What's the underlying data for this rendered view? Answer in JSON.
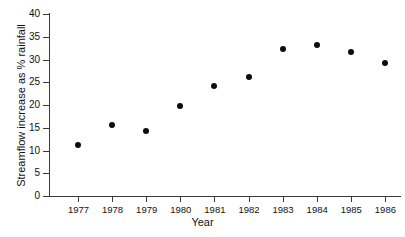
{
  "chart_data": {
    "type": "scatter",
    "title": "",
    "xlabel": "Year",
    "ylabel": "Streamflow increase as % rainfall",
    "categories": [
      "1977",
      "1978",
      "1979",
      "1980",
      "1981",
      "1982",
      "1983",
      "1984",
      "1985",
      "1986"
    ],
    "x": [
      1977,
      1978,
      1979,
      1980,
      1981,
      1982,
      1983,
      1984,
      1985,
      1986
    ],
    "values": [
      11.1,
      15.6,
      14.2,
      19.7,
      24.2,
      26.1,
      32.2,
      33.2,
      31.7,
      29.3
    ],
    "series": [
      {
        "name": "Streamflow increase",
        "values": [
          11.1,
          15.6,
          14.2,
          19.7,
          24.2,
          26.1,
          32.2,
          33.2,
          31.7,
          29.3
        ]
      }
    ],
    "ylim": [
      0,
      40
    ],
    "ytick_labels": [
      "0",
      "5",
      "10",
      "15",
      "20",
      "25",
      "30",
      "35",
      "40"
    ],
    "ytick_values": [
      0,
      5,
      10,
      15,
      20,
      25,
      30,
      35,
      40
    ],
    "xtick_labels": [
      "1977",
      "1978",
      "1979",
      "1980",
      "1981",
      "1982",
      "1983",
      "1984",
      "1985",
      "1986"
    ],
    "grid": false,
    "legend": false,
    "legend_position": "none",
    "marker_color": "#0d0d0d",
    "axis_color": "#3a3a3a",
    "background_color": "#ffffff"
  }
}
